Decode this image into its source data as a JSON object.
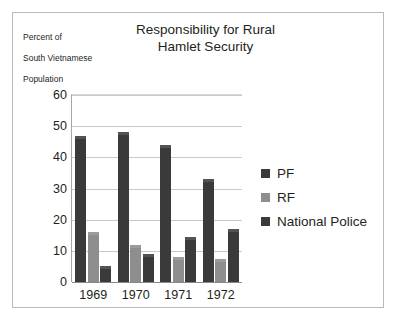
{
  "chart_data": {
    "type": "bar",
    "title": "Responsibility for Rural Hamlet Security",
    "title_line1": "Responsibility for Rural",
    "title_line2": "Hamlet Security",
    "ylabel": "Percent of South Vietnamese Population",
    "ylabel_line1": "Percent of",
    "ylabel_line2": "South Vietnamese",
    "ylabel_line3": "Population",
    "xlabel": "",
    "categories": [
      "1969",
      "1970",
      "1971",
      "1972"
    ],
    "series": [
      {
        "name": "PF",
        "color": "#3a3a3a",
        "values": [
          47,
          48,
          44,
          33
        ]
      },
      {
        "name": "RF",
        "color": "#8e8e8e",
        "values": [
          16,
          12,
          8,
          7.5
        ]
      },
      {
        "name": "National Police",
        "color": "#3a3a3a",
        "values": [
          5,
          9,
          14.5,
          17
        ]
      }
    ],
    "ylim": [
      0,
      60
    ],
    "yticks": [
      0,
      10,
      20,
      30,
      40,
      50,
      60
    ],
    "ytick_labels": [
      "0",
      "10",
      "20",
      "30",
      "40",
      "50",
      "60"
    ],
    "grid": true,
    "legend_position": "right"
  },
  "legend": {
    "items": [
      {
        "label": "PF",
        "color": "#3a3a3a"
      },
      {
        "label": "RF",
        "color": "#8e8e8e"
      },
      {
        "label": "National Police",
        "color": "#3a3a3a"
      }
    ]
  }
}
